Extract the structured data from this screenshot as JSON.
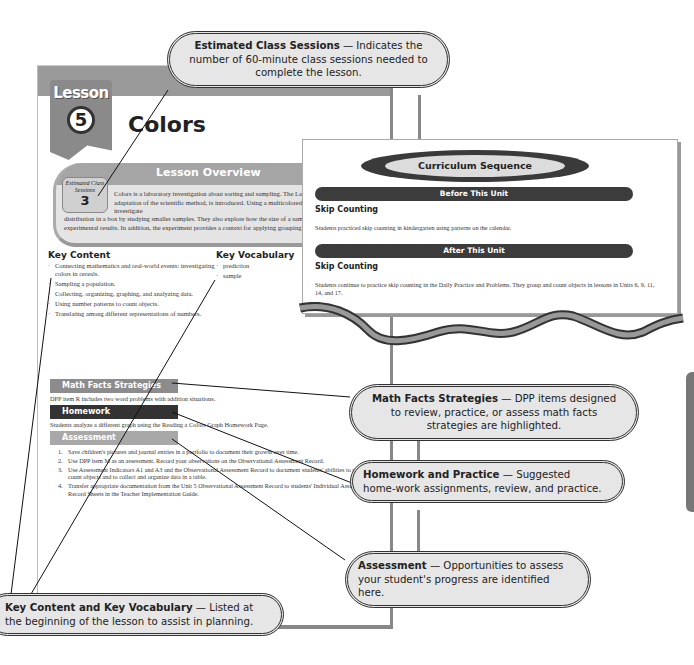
{
  "lesson_page": {
    "badge_word": "Lesson",
    "badge_number": "5",
    "title": "Colors",
    "overview": {
      "title": "Lesson Overview",
      "sessions_label": "Estimated Class Sessions",
      "sessions_value": "3",
      "text_top": "Colors is a laboratory investigation about sorting and sampling. The Laboratory Method, a four-step adaptation of the scientific method, is introduced. Using a multicolored breakfast cereal, students investigate",
      "text_bottom": "distribution in a box by studying smaller samples. They also explore how the size of a sample can have an effect on experimental results. In addition, the experiment provides a context for applying grouping and skip counting."
    },
    "key_content": {
      "heading": "Key Content",
      "items": [
        "Connecting mathematics and real-world events: investigating colors in cereals.",
        "Sampling a population.",
        "Collecting, organizing, graphing, and analyzing data.",
        "Using number patterns to count objects.",
        "Translating among different representations of numbers."
      ]
    },
    "key_vocabulary": {
      "heading": "Key Vocabulary",
      "items": [
        "prediction",
        "sample"
      ]
    },
    "math_facts": {
      "heading": "Math Facts Strategies",
      "text": "DPP item R includes two word problems with addition situations."
    },
    "homework": {
      "heading": "Homework",
      "text": "Students analyze a different graph using the Reading a Colors Graph Homework Page."
    },
    "assessment": {
      "heading": "Assessment",
      "items": [
        "Save children's pictures and journal entries in a portfolio to document their growth over time.",
        "Use DPP item M as an assessment. Record your observations on the Observational Assessment Record.",
        "Use Assessment Indicators A1 and A3 and the Observational Assessment Record to document students' abilities to group and count objects and to collect and organize data in a table.",
        "Transfer appropriate documentation from the Unit 5 Observational Assessment Record to students' Individual Assessment Record Sheets in the Teacher Implementation Guide."
      ]
    },
    "footer": "54   URG • Grade 1 • Unit 5 • Lesson 5"
  },
  "curriculum_sequence": {
    "title": "Curriculum Sequence",
    "before": {
      "bar": "Before This Unit",
      "heading": "Skip Counting",
      "text": "Students practiced skip counting in kindergarten using patterns on the calendar."
    },
    "after": {
      "bar": "After This Unit",
      "heading": "Skip Counting",
      "text": "Students continue to practice skip counting in the Daily Practice and Problems. They group and count objects in lessons in Units 6, 9, 11, 14, and 17."
    }
  },
  "callouts": {
    "estimated": {
      "bold": "Estimated Class Sessions",
      "text": " — Indicates the number of 60-minute class sessions needed to complete the lesson."
    },
    "math_facts": {
      "bold": "Math Facts Strategies",
      "text": " — DPP items designed to review, practice, or assess math facts strategies are highlighted."
    },
    "homework": {
      "bold": "Homework and Practice",
      "text": " — Suggested home-work assignments, review, and practice."
    },
    "assessment": {
      "bold": "Assessment",
      "text": " — Opportunities to assess your student's progress are identified here."
    },
    "key_content": {
      "bold": "Key Content and Key Vocabulary",
      "text": " — Listed at the beginning of the lesson to assist in planning."
    }
  }
}
